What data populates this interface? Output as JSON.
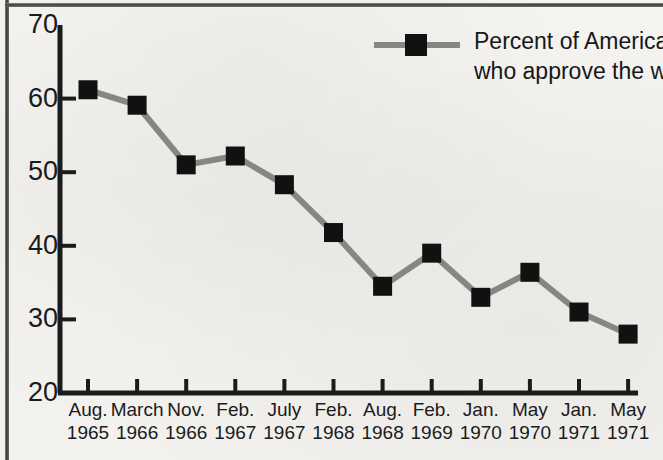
{
  "chart_data": {
    "type": "line",
    "title": "",
    "subtitle": "",
    "xlabel": "",
    "ylabel": "",
    "ylim": [
      20,
      70
    ],
    "yticks": [
      20,
      30,
      40,
      50,
      60,
      70
    ],
    "grid": false,
    "legend_position": "top-right",
    "legend_entries": [
      "Percent of Americans who approve the war"
    ],
    "marker": "square",
    "line_color": "#878682",
    "marker_color": "#111111",
    "axis_color": "#1b1b1b",
    "background_color": "#f2f1ee",
    "categories": [
      "Aug. 1965",
      "March 1966",
      "Nov. 1966",
      "Feb. 1967",
      "July 1967",
      "Feb. 1968",
      "Aug. 1968",
      "Feb. 1969",
      "Jan. 1970",
      "May 1970",
      "Jan. 1971",
      "May 1971"
    ],
    "x_tick_months": [
      "Aug.",
      "March",
      "Nov.",
      "Feb.",
      "July",
      "Feb.",
      "Aug.",
      "Feb.",
      "Jan.",
      "May",
      "Jan.",
      "May"
    ],
    "x_tick_years": [
      "1965",
      "1966",
      "1966",
      "1967",
      "1967",
      "1968",
      "1968",
      "1969",
      "1970",
      "1970",
      "1971",
      "1971"
    ],
    "series": [
      {
        "name": "Percent of Americans who approve the war",
        "values": [
          61.2,
          59.1,
          51.0,
          52.2,
          48.3,
          41.8,
          34.5,
          39.0,
          33.0,
          36.4,
          31.0,
          28.0
        ]
      }
    ]
  },
  "legend": {
    "line1": "Percent of Americans",
    "line2": "who approve the war"
  },
  "axis": {
    "y_tick_labels": [
      "70",
      "60",
      "50",
      "40",
      "30",
      "20"
    ]
  }
}
